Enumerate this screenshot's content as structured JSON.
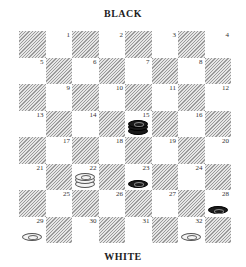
{
  "top_label": "BLACK",
  "bottom_label": "WHITE",
  "squares": [
    "1",
    "2",
    "3",
    "4",
    "5",
    "6",
    "7",
    "8",
    "9",
    "10",
    "11",
    "12",
    "13",
    "14",
    "15",
    "16",
    "17",
    "18",
    "19",
    "20",
    "21",
    "22",
    "23",
    "24",
    "25",
    "26",
    "27",
    "28",
    "29",
    "30",
    "31",
    "32"
  ],
  "pieces": [
    {
      "square": 15,
      "color": "black",
      "king": true
    },
    {
      "square": 22,
      "color": "white",
      "king": true
    },
    {
      "square": 23,
      "color": "black",
      "king": false
    },
    {
      "square": 28,
      "color": "black",
      "king": false
    },
    {
      "square": 29,
      "color": "white",
      "king": false
    },
    {
      "square": 32,
      "color": "white",
      "king": false
    }
  ]
}
